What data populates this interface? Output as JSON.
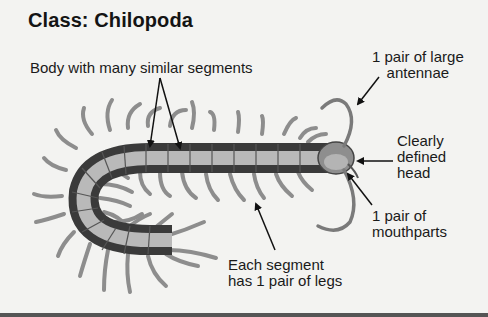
{
  "title": "Class: Chilopoda",
  "labels": {
    "body": "Body with many similar segments",
    "antennae_line1": "1 pair of large",
    "antennae_line2": "antennae",
    "head_line1": "Clearly",
    "head_line2": "defined",
    "head_line3": "head",
    "mouthparts_line1": "1 pair of",
    "mouthparts_line2": "mouthparts",
    "legs_line1": "Each segment",
    "legs_line2": "has 1 pair of legs"
  },
  "illustration": {
    "subject": "centipede",
    "colors": {
      "background": "#f3f3f1",
      "body_dark": "#3a3a3a",
      "body_light": "#b8b8b8",
      "leg": "#9a9a9a",
      "arrow": "#111111"
    }
  }
}
